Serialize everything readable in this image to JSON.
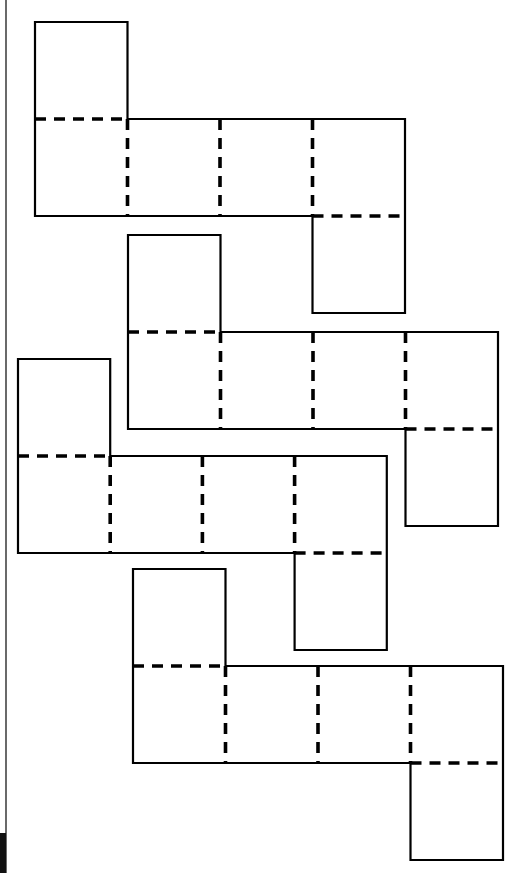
{
  "diagram": {
    "title": "",
    "legend": {
      "solid_line": "cut edge",
      "dashed_line": "fold line"
    },
    "colors": {
      "line": "#000000",
      "background": "#ffffff"
    },
    "nets": [
      {
        "id": "net-1",
        "faces": 6,
        "layout": "1-4-1",
        "top_flap_column": 1,
        "bottom_flap_column": 4,
        "fold_lines": 5
      },
      {
        "id": "net-2",
        "faces": 6,
        "layout": "1-4-1",
        "top_flap_column": 1,
        "bottom_flap_column": 4,
        "fold_lines": 5
      },
      {
        "id": "net-3",
        "faces": 6,
        "layout": "1-4-1",
        "top_flap_column": 1,
        "bottom_flap_column": 4,
        "fold_lines": 5
      },
      {
        "id": "net-4",
        "faces": 6,
        "layout": "1-4-1",
        "top_flap_column": 1,
        "bottom_flap_column": 4,
        "fold_lines": 5
      }
    ]
  }
}
